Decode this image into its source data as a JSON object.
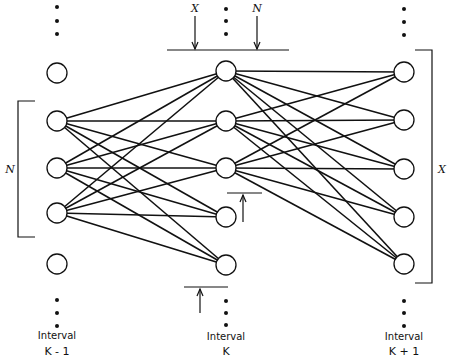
{
  "diagram": {
    "type": "network-trellis",
    "line_color": "#111111",
    "node_fill": "#ffffff",
    "node_radius": 10,
    "columns": [
      {
        "id": "k_minus_1",
        "label_line1": "Interval",
        "label_line2": "K - 1",
        "x": 57,
        "node_ys": [
          73,
          121,
          168,
          213,
          264
        ],
        "top_dots_ys": [
          7,
          21,
          34
        ],
        "bottom_dots_ys": [
          300,
          313,
          326
        ],
        "label_y1": 339,
        "label_y2": 355
      },
      {
        "id": "k",
        "label_line1": "Interval",
        "label_line2": "K",
        "x": 226,
        "node_ys": [
          71,
          121,
          168,
          217,
          265
        ],
        "top_dots_ys": [
          9,
          21,
          34
        ],
        "bottom_dots_ys": [
          301,
          313,
          325
        ],
        "label_y1": 340,
        "label_y2": 355
      },
      {
        "id": "k_plus_1",
        "label_line1": "Interval",
        "label_line2": "K + 1",
        "x": 404,
        "node_ys": [
          72,
          120,
          169,
          217,
          264
        ],
        "top_dots_ys": [
          9,
          22,
          35
        ],
        "bottom_dots_ys": [
          301,
          313,
          326
        ],
        "label_y1": 340,
        "label_y2": 355
      }
    ],
    "edges_left_to_middle": {
      "from_indices": [
        1,
        2,
        3
      ],
      "to_indices": [
        0,
        1,
        2,
        3,
        4
      ]
    },
    "edges_middle_to_right": {
      "from_indices": [
        0,
        1,
        2
      ],
      "to_indices": [
        0,
        1,
        2,
        3,
        4
      ]
    },
    "top_marker": {
      "line": {
        "x1": 167,
        "x2": 289,
        "y": 50
      },
      "arrows": [
        {
          "label": "X",
          "x": 195,
          "y_top": 16,
          "y_bottom": 49
        },
        {
          "label": "N",
          "x": 257,
          "y_top": 16,
          "y_bottom": 49
        }
      ]
    },
    "side_marker": {
      "line": {
        "x1": 227,
        "x2": 262,
        "y": 193
      },
      "arrow": {
        "x": 243,
        "y_top": 195,
        "y_bottom": 222
      }
    },
    "bottom_marker": {
      "line": {
        "x1": 184,
        "x2": 228,
        "y": 287
      },
      "arrow": {
        "x": 200,
        "y_top": 289,
        "y_bottom": 313
      }
    },
    "left_bracket": {
      "label": "N",
      "x": 18,
      "y_top": 101,
      "y_bottom": 237,
      "tick_x": 35,
      "label_x": 10,
      "label_y": 173
    },
    "right_bracket": {
      "label": "X",
      "x": 432,
      "y_top": 50,
      "y_bottom": 283,
      "tick_x": 415,
      "label_x": 442,
      "label_y": 173
    }
  }
}
